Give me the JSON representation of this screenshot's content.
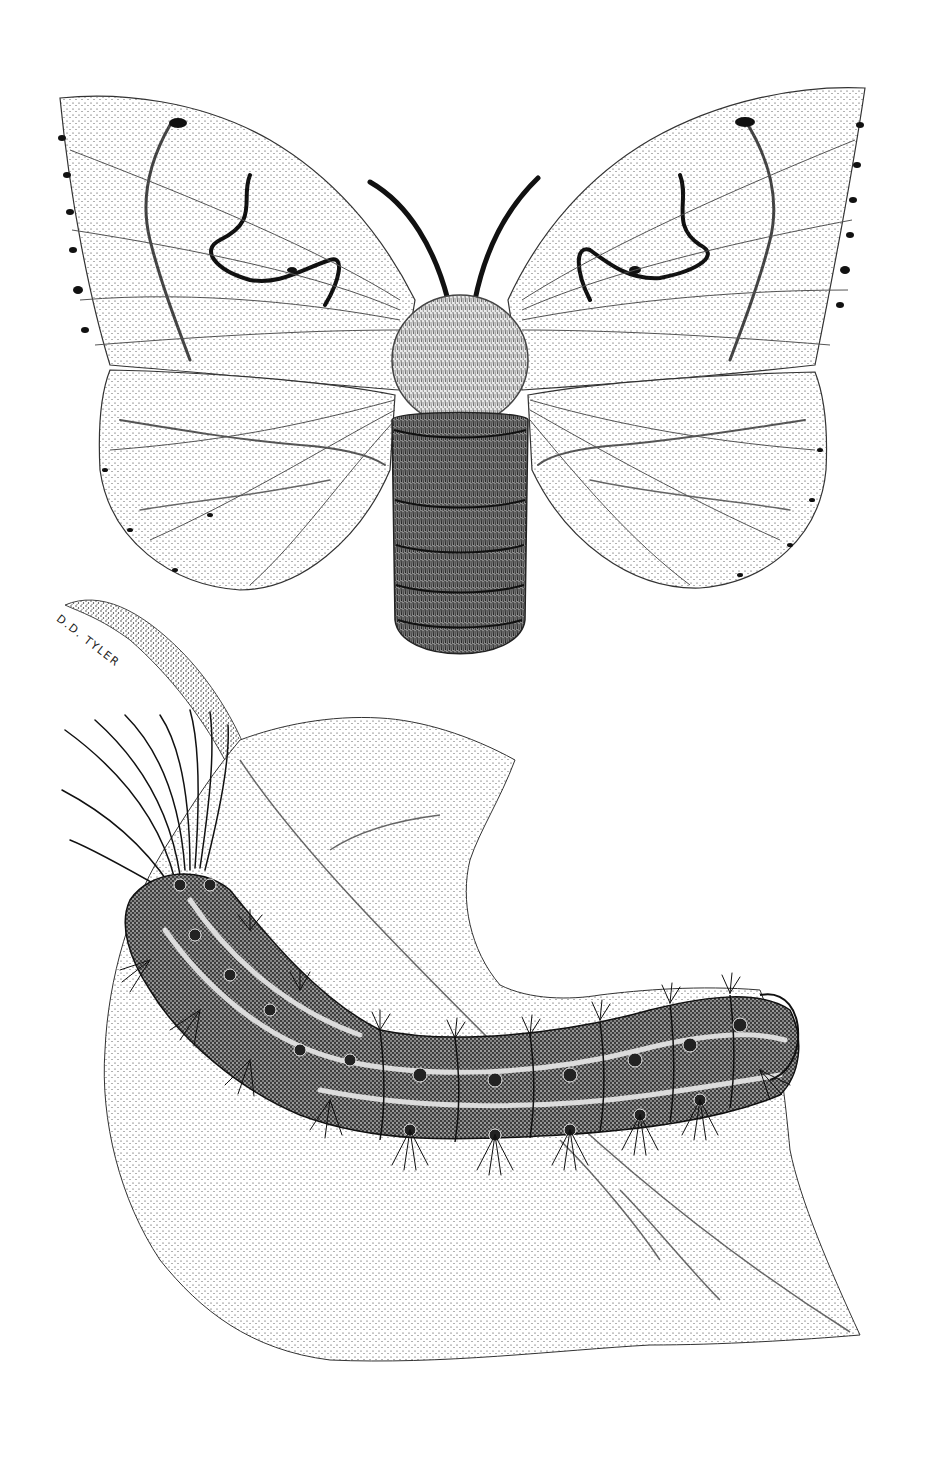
{
  "illustration": {
    "style": "black-and-white stipple pen-and-ink drawing",
    "background_color": "#ffffff",
    "ink_color": "#111111",
    "subjects": [
      {
        "name": "moth",
        "description": "adult moth, dorsal view, wings spread, fuzzy thorax and segmented abdomen, two dark antennae, wavy dark bands and marginal dots on wings"
      },
      {
        "name": "caterpillar",
        "description": "hairy segmented caterpillar with long hair tufts at head, paired tubercles along back, lying on a leaf"
      },
      {
        "name": "leaf",
        "description": "serrated leaf with a chewed-out notch along upper edge, stippled shading, midrib and veins"
      }
    ],
    "signature": "D.D. TYLER"
  }
}
